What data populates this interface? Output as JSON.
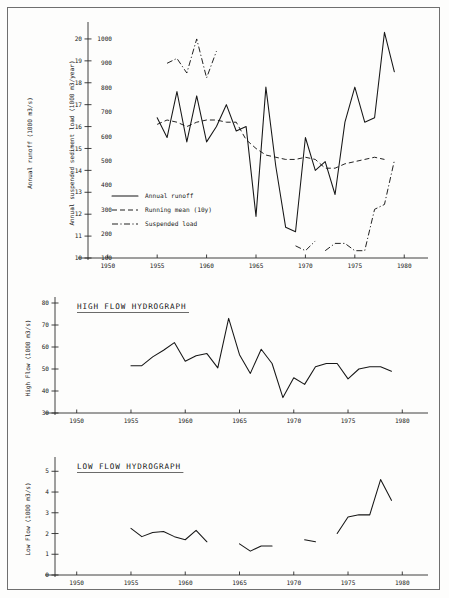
{
  "figure": {
    "background": "#fdfdfc",
    "ink": "#161616",
    "border_color": "#6f6f6f"
  },
  "chart_data": [
    {
      "id": "annual-runoff-sediment",
      "type": "line",
      "title": "",
      "xlabel": "",
      "ylabel": "Annual runoff (1000 m3/s)",
      "ylabel_secondary": "Annual suspended sediment load (1000 m3/year)",
      "xlim": [
        1948,
        1982
      ],
      "ylim": [
        10,
        20.5
      ],
      "ylim_secondary": [
        100,
        1000
      ],
      "grid": false,
      "xticks": [
        1950,
        1955,
        1960,
        1965,
        1970,
        1975,
        1980
      ],
      "xticklabels": [
        "1950",
        "1955",
        "1960",
        "1965",
        "1970",
        "1975",
        "1980"
      ],
      "yticks": [
        10,
        11,
        12,
        13,
        14,
        15,
        16,
        17,
        18,
        19,
        20
      ],
      "yticklabels": [
        "10",
        "11",
        "12",
        "13",
        "14",
        "15",
        "16",
        "17",
        "18",
        "19",
        "20"
      ],
      "yticks_secondary": [
        100,
        200,
        300,
        400,
        500,
        600,
        700,
        800,
        900,
        1000
      ],
      "yticklabels_secondary": [
        "100",
        "200",
        "300",
        "400",
        "500",
        "600",
        "700",
        "800",
        "900",
        "1000"
      ],
      "legend_position": "left-lower",
      "series": [
        {
          "name": "Annual runoff",
          "style": "solid",
          "axis": "left",
          "x": [
            1955,
            1956,
            1957,
            1958,
            1959,
            1960,
            1961,
            1962,
            1963,
            1964,
            1965,
            1966,
            1967,
            1968,
            1969,
            1970,
            1971,
            1972,
            1973,
            1974,
            1975,
            1976,
            1977,
            1978,
            1979
          ],
          "values": [
            16.4,
            15.5,
            17.6,
            15.3,
            17.4,
            15.3,
            16.0,
            17.0,
            15.8,
            16.0,
            11.9,
            17.8,
            14.2,
            11.4,
            11.2,
            15.5,
            14.0,
            14.4,
            12.9,
            16.2,
            17.8,
            16.2,
            16.4,
            20.3,
            18.5
          ]
        },
        {
          "name": "Running mean (10y)",
          "style": "dashed",
          "axis": "left",
          "x": [
            1955,
            1956,
            1957,
            1958,
            1959,
            1960,
            1961,
            1962,
            1963,
            1964,
            1965,
            1966,
            1967,
            1968,
            1969,
            1970,
            1971,
            1972,
            1973,
            1974,
            1975,
            1976,
            1977,
            1978
          ],
          "values": [
            16.1,
            16.3,
            16.2,
            16.0,
            16.2,
            16.3,
            16.3,
            16.2,
            16.2,
            15.4,
            15.0,
            14.7,
            14.6,
            14.5,
            14.5,
            14.6,
            14.5,
            14.1,
            14.1,
            14.3,
            14.4,
            14.5,
            14.6,
            14.5
          ]
        },
        {
          "name": "Suspended load",
          "style": "dash-dot",
          "axis": "right",
          "segments": [
            {
              "x": [
                1956,
                1957,
                1958,
                1959,
                1960,
                1961
              ],
              "values": [
                900,
                920,
                860,
                1000,
                840,
                950
              ]
            },
            {
              "x": [
                1969,
                1970,
                1971
              ],
              "values": [
                150,
                130,
                170
              ]
            },
            {
              "x": [
                1972,
                1973,
                1974,
                1975,
                1976,
                1977,
                1978,
                1979
              ],
              "values": [
                130,
                160,
                160,
                130,
                130,
                300,
                320,
                500
              ]
            }
          ]
        }
      ],
      "legend": [
        {
          "label": "Annual runoff",
          "style": "solid"
        },
        {
          "label": "Running mean (10y)",
          "style": "dashed"
        },
        {
          "label": "Suspended load",
          "style": "dash-dot"
        }
      ]
    },
    {
      "id": "high-flow-hydrograph",
      "type": "line",
      "title": "HIGH FLOW HYDROGRAPH",
      "xlabel": "",
      "ylabel": "High Flow (1000 m3/s)",
      "xlim": [
        1948,
        1982
      ],
      "ylim": [
        30,
        80
      ],
      "grid": false,
      "xticks": [
        1950,
        1955,
        1960,
        1965,
        1970,
        1975,
        1980
      ],
      "xticklabels": [
        "1950",
        "1955",
        "1960",
        "1965",
        "1970",
        "1975",
        "1980"
      ],
      "yticks": [
        30,
        40,
        50,
        60,
        70,
        80
      ],
      "yticklabels": [
        "30",
        "40",
        "50",
        "60",
        "70",
        "80"
      ],
      "series": [
        {
          "name": "High flow",
          "style": "solid",
          "axis": "left",
          "x": [
            1955,
            1956,
            1957,
            1958,
            1959,
            1960,
            1961,
            1962,
            1963,
            1964,
            1965,
            1966,
            1967,
            1968,
            1969,
            1970,
            1971,
            1972,
            1973,
            1974,
            1975,
            1976,
            1977,
            1978,
            1979
          ],
          "values": [
            51.5,
            51.5,
            55.5,
            58.5,
            62.0,
            53.5,
            56.0,
            57.0,
            50.5,
            73.0,
            56.5,
            48.0,
            59.0,
            52.5,
            37.0,
            46.0,
            43.0,
            51.0,
            52.5,
            52.5,
            45.5,
            50.0,
            51.0,
            51.0,
            49.0
          ]
        }
      ]
    },
    {
      "id": "low-flow-hydrograph",
      "type": "line",
      "title": "LOW FLOW HYDROGRAPH",
      "xlabel": "",
      "ylabel": "Low Flow (1000 m3/s)",
      "xlim": [
        1948,
        1982
      ],
      "ylim": [
        0,
        5.4
      ],
      "grid": false,
      "xticks": [
        1950,
        1955,
        1960,
        1965,
        1970,
        1975,
        1980
      ],
      "xticklabels": [
        "1950",
        "1955",
        "1960",
        "1965",
        "1970",
        "1975",
        "1980"
      ],
      "yticks": [
        0,
        1,
        2,
        3,
        4,
        5
      ],
      "yticklabels": [
        "0",
        "1",
        "2",
        "3",
        "4",
        "5"
      ],
      "series": [
        {
          "name": "Low flow",
          "style": "solid",
          "axis": "left",
          "segments": [
            {
              "x": [
                1955,
                1956,
                1957,
                1958,
                1959,
                1960,
                1961,
                1962
              ],
              "values": [
                2.25,
                1.85,
                2.05,
                2.1,
                1.85,
                1.7,
                2.15,
                1.6
              ]
            },
            {
              "x": [
                1965,
                1966,
                1967,
                1968
              ],
              "values": [
                1.5,
                1.15,
                1.4,
                1.4
              ]
            },
            {
              "x": [
                1971,
                1972
              ],
              "values": [
                1.7,
                1.6
              ]
            },
            {
              "x": [
                1974,
                1975,
                1976,
                1977,
                1978,
                1979
              ],
              "values": [
                2.0,
                2.8,
                2.9,
                2.9,
                4.6,
                3.6
              ]
            }
          ]
        }
      ]
    }
  ]
}
